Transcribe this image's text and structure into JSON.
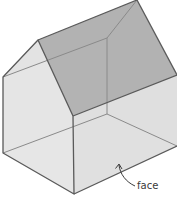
{
  "figure": {
    "labels": {
      "face": "face"
    },
    "colors": {
      "edge": "#5a5a5a",
      "hidden_edge": "#8a8a8a",
      "roof_shaded": "#a9a9a9",
      "roof_light": "#d2d2d2",
      "front_face": "#e2e2e2",
      "side_face": "#dcdcdc",
      "floor": "#ececec",
      "back_wall": "#cfcfcf"
    }
  }
}
